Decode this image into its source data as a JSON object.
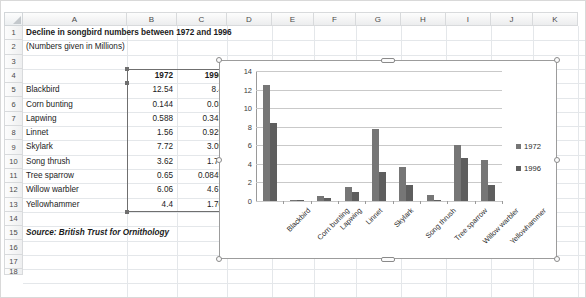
{
  "spreadsheet": {
    "column_headers": [
      "A",
      "B",
      "C",
      "D",
      "E",
      "F",
      "G",
      "H",
      "I",
      "J",
      "K"
    ],
    "row_headers": [
      "1",
      "2",
      "3",
      "4",
      "5",
      "6",
      "7",
      "8",
      "9",
      "10",
      "11",
      "12",
      "13",
      "14",
      "15",
      "16",
      "17",
      "18"
    ],
    "cells": {
      "a1": "Decline in songbird numbers between 1972 and 1996",
      "a2": "(Numbers given in Millions)",
      "b4": "1972",
      "c4": "1996",
      "a15": "Source: British Trust for Ornithology"
    },
    "table_rows": [
      {
        "row": "5",
        "name": "Blackbird",
        "v1972": "12.54",
        "v1996": "8.4"
      },
      {
        "row": "6",
        "name": "Corn bunting",
        "v1972": "0.144",
        "v1996": "0.03"
      },
      {
        "row": "7",
        "name": "Lapwing",
        "v1972": "0.588",
        "v1996": "0.341"
      },
      {
        "row": "8",
        "name": "Linnet",
        "v1972": "1.56",
        "v1996": "0.925"
      },
      {
        "row": "9",
        "name": "Skylark",
        "v1972": "7.72",
        "v1996": "3.09"
      },
      {
        "row": "10",
        "name": "Song thrush",
        "v1972": "3.62",
        "v1996": "1.74"
      },
      {
        "row": "11",
        "name": "Tree sparrow",
        "v1972": "0.65",
        "v1996": "0.0845"
      },
      {
        "row": "12",
        "name": "Willow warbler",
        "v1972": "6.06",
        "v1996": "4.67"
      },
      {
        "row": "13",
        "name": "Yellowhammer",
        "v1972": "4.4",
        "v1996": "1.76"
      }
    ],
    "selected_range": "B4:C13"
  },
  "chart_data": {
    "type": "bar",
    "title": "",
    "xlabel": "",
    "ylabel": "",
    "ylim": [
      0,
      14
    ],
    "yticks": [
      0,
      2,
      4,
      6,
      8,
      10,
      12,
      14
    ],
    "grid": true,
    "legend_position": "right",
    "categories": [
      "Blackbird",
      "Corn bunting",
      "Lapwing",
      "Linnet",
      "Skylark",
      "Song thrush",
      "Tree sparrow",
      "Willow warbler",
      "Yellowhammer"
    ],
    "series": [
      {
        "name": "1972",
        "color": "#767676",
        "values": [
          12.54,
          0.144,
          0.588,
          1.56,
          7.72,
          3.62,
          0.65,
          6.06,
          4.4
        ]
      },
      {
        "name": "1996",
        "color": "#5e5e5e",
        "values": [
          8.4,
          0.03,
          0.341,
          0.925,
          3.09,
          1.74,
          0.0845,
          4.67,
          1.76
        ]
      }
    ]
  },
  "colors": {
    "series_1972": "#767676",
    "series_1996": "#5e5e5e",
    "gridline": "#c9c9c9",
    "axis": "#9a9a9a",
    "sheet_grid": "#e4e7ea"
  }
}
